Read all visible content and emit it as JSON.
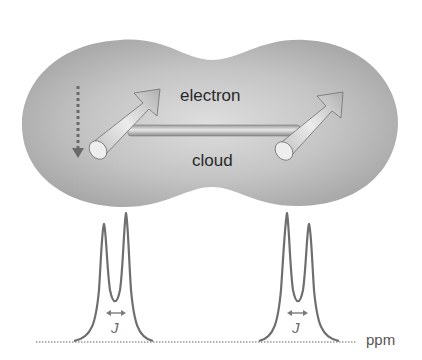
{
  "diagram": {
    "title": "",
    "cloud": {
      "label_top": "electron",
      "label_bottom": "cloud",
      "fill_outer": "#a9a9a9",
      "fill_inner": "#d6d6d6"
    },
    "spins": [
      {
        "name": "left-spin",
        "direction": "up-right"
      },
      {
        "name": "right-spin",
        "direction": "up-right"
      }
    ],
    "bond": {
      "label": ""
    },
    "dotted_arrow": {
      "direction": "down"
    },
    "spectrum": {
      "axis_label": "ppm",
      "doublets": [
        {
          "name": "left-doublet",
          "coupling_label": "J"
        },
        {
          "name": "right-doublet",
          "coupling_label": "J"
        }
      ],
      "line_color": "#707070"
    }
  }
}
